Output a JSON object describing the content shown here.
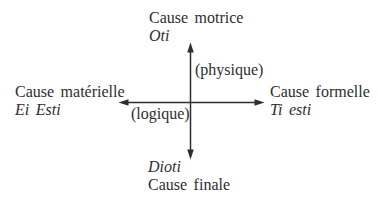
{
  "page": {
    "colors": {
      "paper": "#ffffff",
      "ink": "#2e2e2e"
    }
  },
  "diagram": {
    "type": "cross-axes",
    "top": {
      "title": "Cause motrice",
      "term": "Oti"
    },
    "left": {
      "title": "Cause matérielle",
      "term": "Ei Esti"
    },
    "right": {
      "title": "Cause formelle",
      "term": "Ti esti"
    },
    "bottom": {
      "term": "Dioti",
      "title": "Cause finale"
    },
    "vertical_axis_label": "(physique)",
    "horizontal_axis_label": "(logique)"
  }
}
